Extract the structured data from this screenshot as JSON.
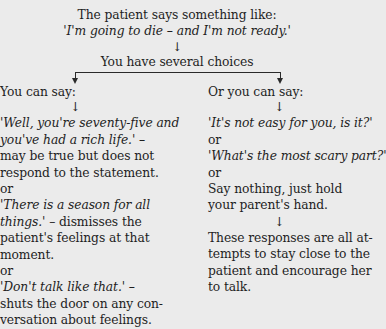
{
  "header": {
    "intro": "The patient says something like:",
    "quote": "'I'm going to die – and I'm not ready.'",
    "arrow": "↓",
    "choices": "You have several choices"
  },
  "left": {
    "heading": "You can say:",
    "arrow": "↓",
    "lines": [
      {
        "text": "'Well, you're seventy-five and",
        "italic": true
      },
      {
        "text": "you've had a rich life.' –",
        "italic": true
      },
      {
        "text": "may be true but does not",
        "italic": false
      },
      {
        "text": "respond to the statement.",
        "italic": false
      },
      {
        "text": "or",
        "italic": false
      },
      {
        "text": "'There is a season for all",
        "italic": true
      },
      {
        "text": "things.' – dismisses the",
        "italic": "partial"
      },
      {
        "text": "patient's feelings at that",
        "italic": false
      },
      {
        "text": "moment.",
        "italic": false
      },
      {
        "text": "or",
        "italic": false
      },
      {
        "text": "'Don't talk like that.' –",
        "italic": true
      },
      {
        "text": "shuts the door on any con-",
        "italic": false
      },
      {
        "text": "versation about feelings.",
        "italic": false
      }
    ],
    "l6_italic": "things.'",
    "l6_rest": " – dismisses the"
  },
  "right": {
    "heading": "Or you can say:",
    "arrow": "↓",
    "lines": [
      {
        "text": "'It's not easy for you, is it?'",
        "italic": true
      },
      {
        "text": "or",
        "italic": false
      },
      {
        "text": "'What's the most scary part?'",
        "italic": true
      },
      {
        "text": "or",
        "italic": false
      },
      {
        "text": "Say nothing, just hold",
        "italic": false
      },
      {
        "text": "your parent's hand.",
        "italic": false
      }
    ],
    "arrow2": "↓",
    "conclusion": [
      "These responses are all at-",
      "tempts to stay close to the",
      "patient and encourage her",
      "to talk."
    ]
  }
}
